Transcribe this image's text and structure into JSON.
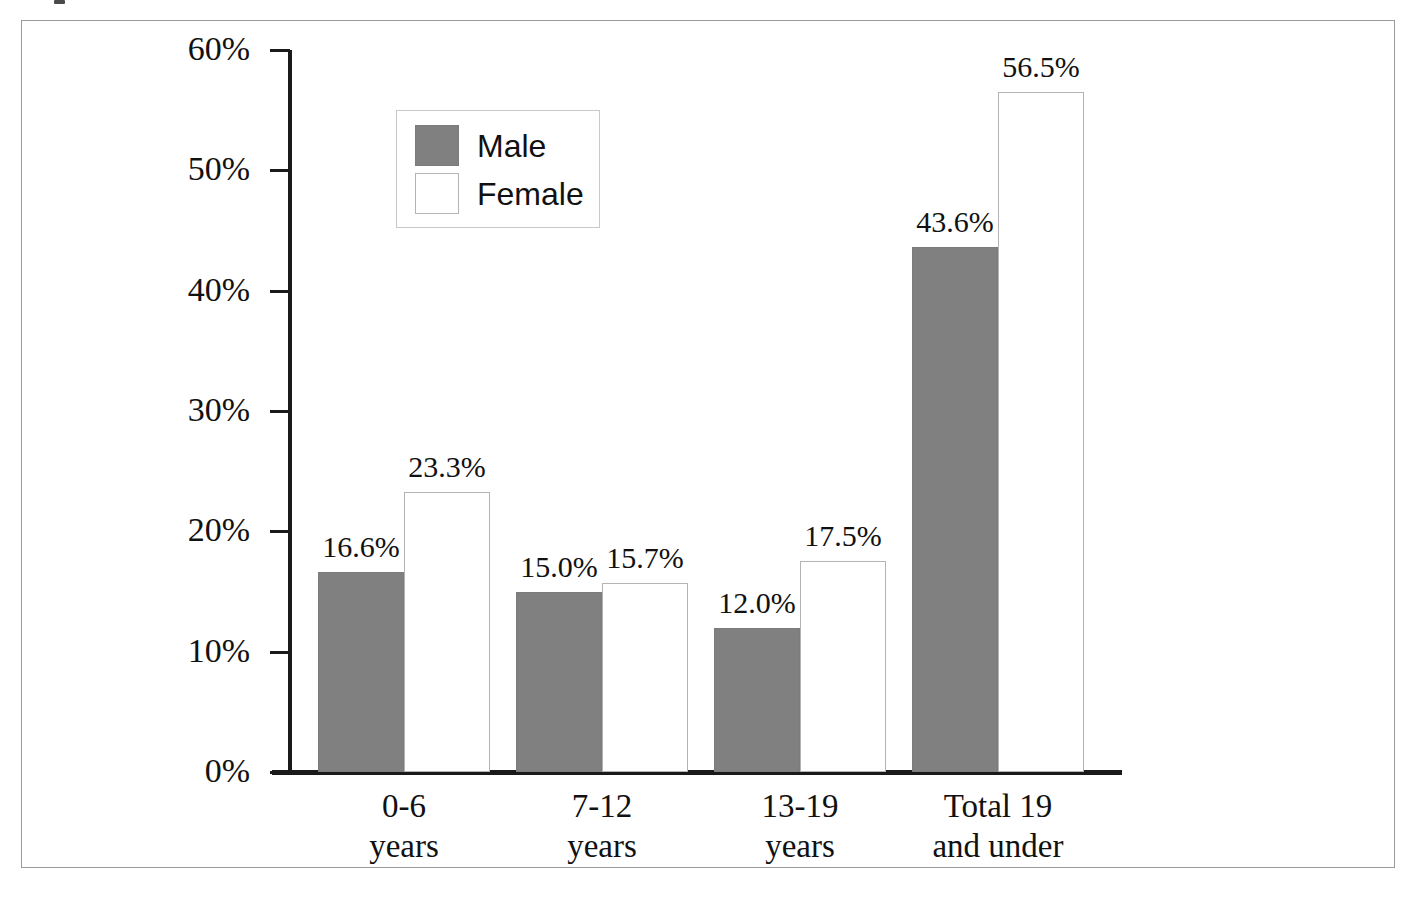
{
  "chart_data": {
    "type": "bar",
    "title": "",
    "subtitle": "",
    "xlabel": "",
    "ylabel": "",
    "ylim": [
      0,
      60
    ],
    "ytick_step": 10,
    "grid": false,
    "legend_position": "upper-left-inside",
    "categories": [
      "0-6 years",
      "7-12 years",
      "13-19 years",
      "Total 19 and under"
    ],
    "category_lines": [
      [
        "0-6",
        "years"
      ],
      [
        "7-12",
        "years"
      ],
      [
        "13-19",
        "years"
      ],
      [
        "Total 19",
        "and under"
      ]
    ],
    "ytick_labels": [
      "0%",
      "10%",
      "20%",
      "30%",
      "40%",
      "50%",
      "60%"
    ],
    "ytick_values": [
      0,
      10,
      20,
      30,
      40,
      50,
      60
    ],
    "series": [
      {
        "name": "Male",
        "color": "#808080",
        "values": [
          16.6,
          15.0,
          12.0,
          43.6
        ],
        "value_labels": [
          "16.6%",
          "15.0%",
          "12.0%",
          "43.6%"
        ]
      },
      {
        "name": "Female",
        "color": "#ffffff",
        "values": [
          23.3,
          15.7,
          17.5,
          56.5
        ],
        "value_labels": [
          "23.3%",
          "15.7%",
          "17.5%",
          "56.5%"
        ]
      }
    ]
  },
  "legend": {
    "entries": [
      {
        "label": "Male",
        "swatch": "filled-grey-square"
      },
      {
        "label": "Female",
        "swatch": "open-white-square"
      }
    ]
  },
  "colors": {
    "male_bar": "#808080",
    "female_bar": "#ffffff",
    "female_bar_outline": "#b4b4b4",
    "axis": "#1a1a1a",
    "frame": "#9a9a9a",
    "text": "#111111",
    "background": "#ffffff"
  }
}
